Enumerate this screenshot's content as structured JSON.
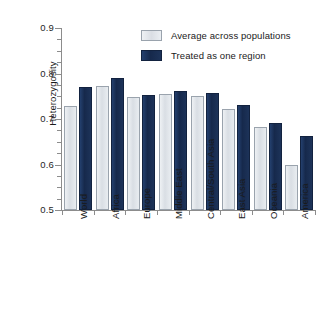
{
  "chart_data": {
    "type": "bar",
    "title": "",
    "xlabel": "",
    "ylabel": "Heterozygosity",
    "ylim": [
      0.5,
      0.9
    ],
    "ytick_labels": [
      "0.9",
      "0.8",
      "0.7",
      "0.6",
      "0.5"
    ],
    "ytick_values": [
      0.9,
      0.8,
      0.7,
      0.6,
      0.5
    ],
    "minor_tick_step": 0.025,
    "grid": false,
    "legend_position": "top-center",
    "categories": [
      "World",
      "Africa",
      "Europe",
      "Middle East",
      "Central/South Asia",
      "East Asia",
      "Oceania",
      "America"
    ],
    "series": [
      {
        "name": "Average across populations",
        "color": "#dadee4",
        "values": [
          0.728,
          0.772,
          0.749,
          0.756,
          0.75,
          0.723,
          0.683,
          0.6
        ]
      },
      {
        "name": "Treated as one region",
        "color": "#1a3560",
        "values": [
          0.77,
          0.791,
          0.752,
          0.761,
          0.757,
          0.731,
          0.692,
          0.663
        ]
      }
    ]
  },
  "legend": {
    "items": [
      {
        "label": "Average across populations"
      },
      {
        "label": "Treated as one region"
      }
    ]
  }
}
